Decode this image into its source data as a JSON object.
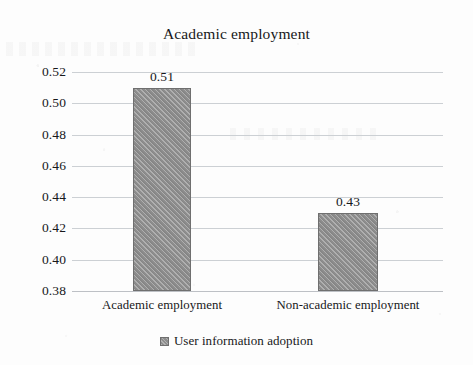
{
  "chart_data": {
    "type": "bar",
    "title": "Academic employment",
    "xlabel": "",
    "ylabel": "",
    "categories": [
      "Academic employment",
      "Non-academic employment"
    ],
    "values": [
      0.51,
      0.43
    ],
    "value_labels": [
      "0.51",
      "0.43"
    ],
    "series": [
      {
        "name": "User information adoption",
        "values": [
          0.51,
          0.43
        ],
        "color": "#8d8d8d"
      }
    ],
    "ylim": [
      0.38,
      0.52
    ],
    "ytick_labels": [
      "0.52",
      "0.50",
      "0.48",
      "0.46",
      "0.44",
      "0.42",
      "0.40",
      "0.38"
    ],
    "ytick_values": [
      0.52,
      0.5,
      0.48,
      0.46,
      0.44,
      0.42,
      0.4,
      0.38
    ],
    "grid": true,
    "legend": {
      "position": "bottom",
      "entries": [
        {
          "label": "User information adoption",
          "swatch_name": "legend-swatch",
          "color": "#8d8d8d"
        }
      ]
    },
    "colors": {
      "bar_fill": "#8d8d8d",
      "bar_border": "#6f6f6f",
      "gridline": "#c9cdd2",
      "text": "#17181a",
      "background": "#fdfdfd"
    }
  }
}
